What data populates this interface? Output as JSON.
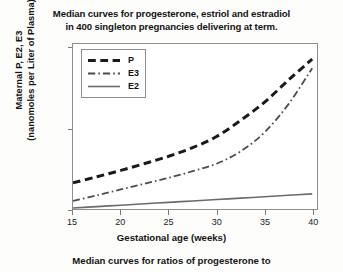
{
  "chart_data": {
    "type": "line",
    "title": "Median curves for progesterone, estriol and estradiol in 400 singleton pregnancies delivering at term.",
    "title_lines": [
      "Median curves for progesterone, estriol and estradiol",
      "in 400 singleton pregnancies delivering at term."
    ],
    "xlabel": "Gestational age (weeks)",
    "ylabel": "Maternal P, E2, E3 (nanomoles per Liter of Plasma)",
    "ylabel_lines": [
      "Maternal P, E2, E3",
      "(nanomoles per Liter of Plasma)"
    ],
    "xlim": [
      15,
      40.5
    ],
    "ylim": [
      0,
      820
    ],
    "xticks": [
      15,
      20,
      25,
      30,
      35,
      40
    ],
    "xtick_labels": [
      "15",
      "20",
      "25",
      "30",
      "35",
      "40"
    ],
    "yticks": [
      0,
      400,
      800
    ],
    "ytick_labels": [
      "0",
      "400",
      "800"
    ],
    "grid": false,
    "legend_position": "upper-left-inside",
    "x": [
      15,
      17.5,
      20,
      22.5,
      25,
      27.5,
      30,
      32.5,
      35,
      37.5,
      40
    ],
    "series": [
      {
        "name": "P",
        "label": "P",
        "style": "dashed",
        "color": "#1a1a1a",
        "width": 3.0,
        "values": [
          130,
          160,
          192,
          226,
          262,
          305,
          360,
          440,
          530,
          640,
          745
        ]
      },
      {
        "name": "E3",
        "label": "E3",
        "style": "dash-dot",
        "color": "#4d4d4d",
        "width": 1.8,
        "values": [
          40,
          68,
          97,
          126,
          155,
          188,
          225,
          286,
          380,
          520,
          700
        ]
      },
      {
        "name": "E2",
        "label": "E2",
        "style": "solid",
        "color": "#6b6b6b",
        "width": 1.6,
        "values": [
          5,
          12,
          19,
          26,
          33,
          40,
          47,
          54,
          61,
          68,
          75
        ]
      }
    ]
  },
  "caption": "Median curves for ratios of progesterone to"
}
